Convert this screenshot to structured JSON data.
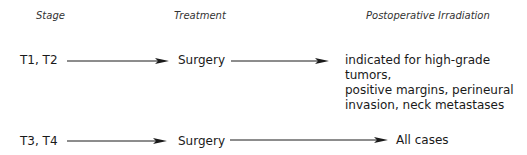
{
  "headers": {
    "stage": "Stage",
    "treatment": "Treatment",
    "postop": "Postoperative Irradiation"
  },
  "rows": [
    {
      "stage": "T1, T2",
      "treatment": "Surgery",
      "postop_lines": [
        "indicated for high-grade tumors,",
        "positive margins, perineural",
        "invasion, neck metastases"
      ]
    },
    {
      "stage": "T3, T4",
      "treatment": "Surgery",
      "postop_lines": [
        "All cases"
      ]
    }
  ],
  "icons": {
    "arrow": "right-arrow-icon"
  },
  "colors": {
    "line": "#1a1a1a",
    "text": "#1a1a1a"
  }
}
